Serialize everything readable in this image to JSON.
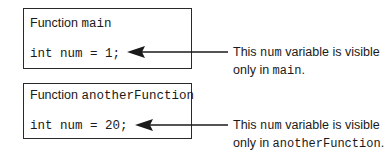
{
  "diagram": {
    "boxes": [
      {
        "title_prefix": "Function ",
        "function_name": "main",
        "code": "int num = 1;",
        "note": {
          "part1": "This ",
          "var": "num",
          "part2": " variable is visible",
          "part3": "only in ",
          "scope": "main",
          "part4": "."
        }
      },
      {
        "title_prefix": "Function ",
        "function_name": "anotherFunction",
        "code": "int num = 20;",
        "note": {
          "part1": "This ",
          "var": "num",
          "part2": " variable is visible",
          "part3": "only in ",
          "scope": "anotherFunction",
          "part4": "."
        }
      }
    ],
    "colors": {
      "line": "#1a1a1a",
      "border": "#2a2a2a"
    }
  }
}
